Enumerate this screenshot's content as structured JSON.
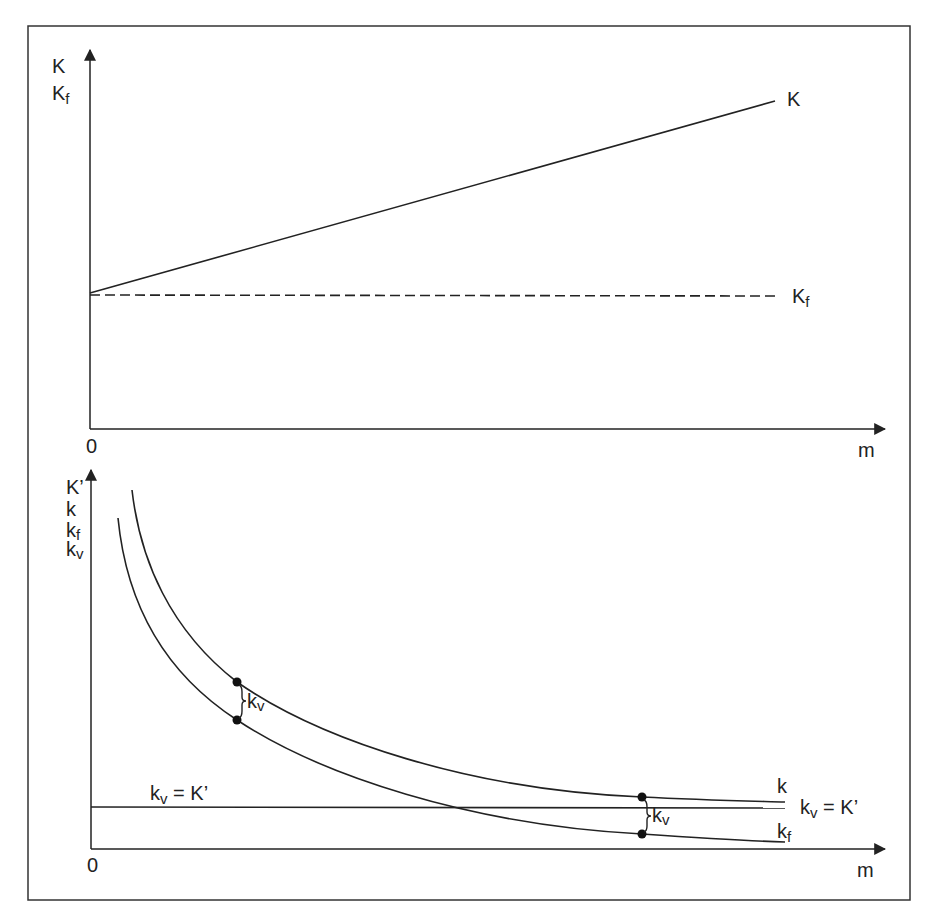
{
  "colors": {
    "background": "#ffffff",
    "ink": "#222222",
    "frame": "#333333"
  },
  "top_panel": {
    "y_axis_label_lines": [
      {
        "main": "K",
        "sub": ""
      },
      {
        "main": "K",
        "sub": "f"
      }
    ],
    "origin_label": "0",
    "x_axis_label": "m",
    "curves": [
      {
        "name": "K",
        "label_main": "K",
        "label_sub": "",
        "style": "solid"
      },
      {
        "name": "Kf",
        "label_main": "K",
        "label_sub": "f",
        "style": "dashed"
      }
    ]
  },
  "bottom_panel": {
    "y_axis_label_lines": [
      {
        "main": "K’",
        "sub": ""
      },
      {
        "main": "k",
        "sub": ""
      },
      {
        "main": "k",
        "sub": "f"
      },
      {
        "main": "k",
        "sub": "v"
      }
    ],
    "origin_label": "0",
    "x_axis_label": "m",
    "curves": [
      {
        "name": "k",
        "label_main": "k",
        "label_sub": "",
        "style": "solid"
      },
      {
        "name": "kf",
        "label_main": "k",
        "label_sub": "f",
        "style": "solid"
      },
      {
        "name": "kv_eq_K_prime",
        "label_main": "k",
        "label_sub": "v",
        "label_rest": " = K’",
        "style": "solid"
      }
    ],
    "left_line_label": {
      "main": "k",
      "sub": "v",
      "rest": " = K’"
    },
    "gap_annotations": [
      {
        "label_main": "k",
        "label_sub": "v",
        "position": "left"
      },
      {
        "label_main": "k",
        "label_sub": "v",
        "position": "right"
      }
    ]
  }
}
